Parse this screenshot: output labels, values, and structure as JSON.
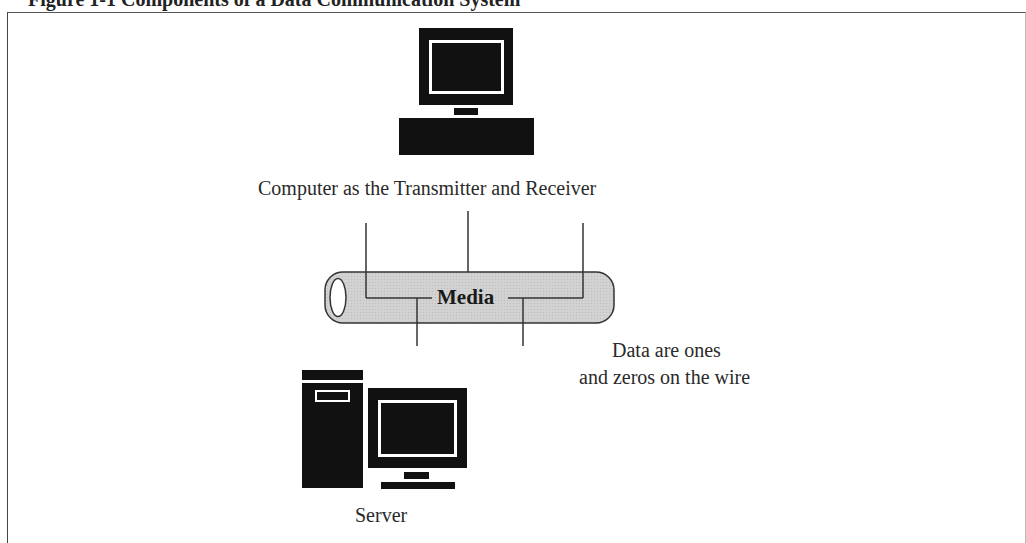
{
  "figure": {
    "title": "Figure 1-1  Components of a Data Communication System"
  },
  "nodes": {
    "computer": {
      "icon": "desktop-computer-icon",
      "label": "Computer as the Transmitter and Receiver"
    },
    "media": {
      "icon": "cable-tube-icon",
      "label": "Media",
      "fill_color": "#d0d0d0"
    },
    "server": {
      "icon": "server-tower-icon",
      "label": "Server"
    }
  },
  "annotations": {
    "data_note_line1": "Data are ones",
    "data_note_line2": "and zeros on the wire"
  },
  "colors": {
    "icon": "#111111",
    "lines": "#333333",
    "background": "#ffffff"
  }
}
